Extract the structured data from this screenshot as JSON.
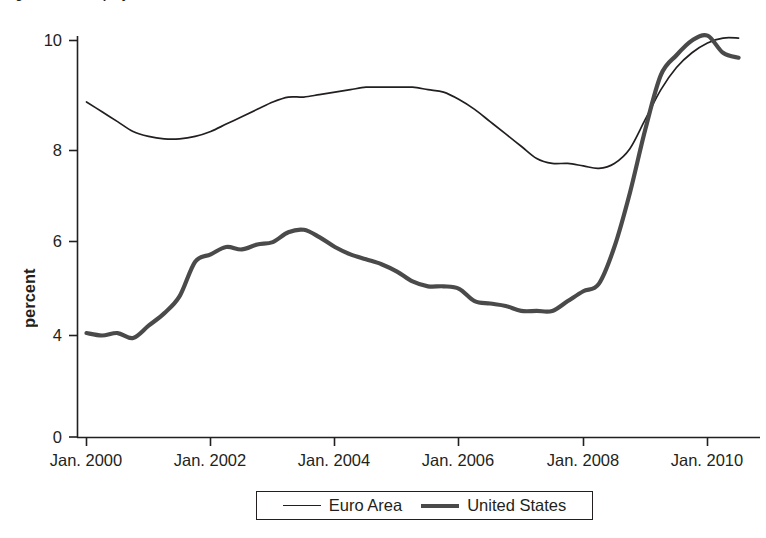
{
  "figure": {
    "title": "Figure 3.2   Unemployment Rates in the Euro Area and the United States, 2000-2010",
    "title_cropped": true
  },
  "axes": {
    "ylabel": "percent",
    "ytick_labels": [
      "10",
      "8",
      "6",
      "4",
      "0"
    ],
    "xtick_labels": [
      "Jan. 2000",
      "Jan. 2002",
      "Jan. 2004",
      "Jan. 2006",
      "Jan. 2008",
      "Jan. 2010"
    ]
  },
  "legend": {
    "items": [
      {
        "label": "Euro Area",
        "style": "thin",
        "color": "#231f20"
      },
      {
        "label": "United States",
        "style": "thick",
        "color": "#4a4a4a"
      }
    ]
  },
  "colors": {
    "axis": "#231f20",
    "euro_area_line": "#231f20",
    "united_states_line": "#4a4a4a",
    "background": "#ffffff"
  },
  "chart_data": {
    "type": "line",
    "title": "Unemployment Rates in the Euro Area and the United States",
    "xlabel": "",
    "ylabel": "percent",
    "x_tick_values": [
      "Jan. 2000",
      "Jan. 2002",
      "Jan. 2004",
      "Jan. 2006",
      "Jan. 2008",
      "Jan. 2010"
    ],
    "x_tick_years": [
      2000,
      2002,
      2004,
      2006,
      2008,
      2010
    ],
    "y_tick_values": [
      10,
      8,
      6,
      4,
      0
    ],
    "ylim": [
      0,
      10.4
    ],
    "xlim": [
      2000.0,
      2010.6
    ],
    "y_axis_note": "Axis has a break between 0 and 4; ticks 4,6,8,10 are evenly spaced and 0 sits below with a compressed gap.",
    "grid": false,
    "legend_position": "below-center",
    "series": [
      {
        "name": "Euro Area",
        "style": "thin",
        "color": "#231f20",
        "x": [
          2000.0,
          2000.25,
          2000.5,
          2000.75,
          2001.0,
          2001.25,
          2001.5,
          2001.75,
          2002.0,
          2002.25,
          2002.5,
          2002.75,
          2003.0,
          2003.25,
          2003.5,
          2003.75,
          2004.0,
          2004.25,
          2004.5,
          2004.75,
          2005.0,
          2005.25,
          2005.5,
          2005.75,
          2006.0,
          2006.25,
          2006.5,
          2006.75,
          2007.0,
          2007.25,
          2007.5,
          2007.75,
          2008.0,
          2008.25,
          2008.5,
          2008.75,
          2009.0,
          2009.25,
          2009.5,
          2009.75,
          2010.0,
          2010.25,
          2010.5
        ],
        "y": [
          8.75,
          8.55,
          8.35,
          8.15,
          8.05,
          8.0,
          8.0,
          8.05,
          8.15,
          8.3,
          8.45,
          8.6,
          8.75,
          8.85,
          8.85,
          8.9,
          8.95,
          9.0,
          9.05,
          9.05,
          9.05,
          9.05,
          9.0,
          8.95,
          8.8,
          8.6,
          8.35,
          8.1,
          7.85,
          7.6,
          7.5,
          7.5,
          7.45,
          7.4,
          7.5,
          7.8,
          8.4,
          9.0,
          9.45,
          9.75,
          9.95,
          10.05,
          10.05
        ]
      },
      {
        "name": "United States",
        "style": "thick",
        "color": "#4a4a4a",
        "x": [
          2000.0,
          2000.25,
          2000.5,
          2000.75,
          2001.0,
          2001.25,
          2001.5,
          2001.75,
          2002.0,
          2002.25,
          2002.5,
          2002.75,
          2003.0,
          2003.25,
          2003.5,
          2003.75,
          2004.0,
          2004.25,
          2004.5,
          2004.75,
          2005.0,
          2005.25,
          2005.5,
          2005.75,
          2006.0,
          2006.25,
          2006.5,
          2006.75,
          2007.0,
          2007.25,
          2007.5,
          2007.75,
          2008.0,
          2008.25,
          2008.5,
          2008.75,
          2009.0,
          2009.25,
          2009.5,
          2009.75,
          2010.0,
          2010.25,
          2010.5
        ],
        "y": [
          4.05,
          4.0,
          4.05,
          3.95,
          4.2,
          4.45,
          4.8,
          5.5,
          5.65,
          5.8,
          5.75,
          5.85,
          5.9,
          6.1,
          6.15,
          6.0,
          5.8,
          5.65,
          5.55,
          5.45,
          5.3,
          5.1,
          5.0,
          5.0,
          4.95,
          4.7,
          4.65,
          4.6,
          4.5,
          4.5,
          4.5,
          4.7,
          4.9,
          5.05,
          5.8,
          6.9,
          8.2,
          9.3,
          9.7,
          10.0,
          10.1,
          9.75,
          9.65
        ]
      }
    ]
  }
}
